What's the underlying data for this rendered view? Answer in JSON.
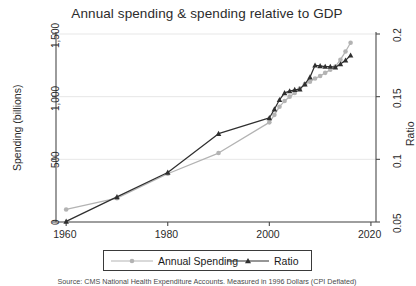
{
  "chart_data": {
    "type": "line",
    "title": "Annual spending & spending relative to GDP",
    "source_note": "Source: CMS National Health Expenditure Accounts. Measured in 1996 Dollars (CPI Deflated)",
    "xlabel": "",
    "ylabel": "Spending (billions)",
    "y2label": "Ratio",
    "xlim": [
      1958,
      2021
    ],
    "ylim": [
      0,
      1500
    ],
    "y2lim": [
      0.05,
      0.2
    ],
    "xticks": [
      "1960",
      "1980",
      "2000",
      "2020"
    ],
    "xtick_values": [
      1960,
      1980,
      2000,
      2020
    ],
    "yticks": [
      "0",
      "500",
      "1,000",
      "1,500"
    ],
    "ytick_values": [
      0,
      500,
      1000,
      1500
    ],
    "y2ticks": [
      "0.05",
      "0.1",
      "0.15",
      "0.2"
    ],
    "y2tick_values": [
      0.05,
      0.1,
      0.15,
      0.2
    ],
    "grid": true,
    "legend_position": "bottom",
    "series": [
      {
        "name": "Annual Spending",
        "axis": "left",
        "color": "#b3b3b3",
        "marker": "circle",
        "x": [
          1960,
          1970,
          1980,
          1990,
          2000,
          2001,
          2002,
          2003,
          2004,
          2005,
          2006,
          2007,
          2008,
          2009,
          2010,
          2011,
          2012,
          2013,
          2014,
          2015,
          2016
        ],
        "y": [
          100,
          190,
          385,
          550,
          795,
          855,
          920,
          965,
          1000,
          1030,
          1065,
          1100,
          1120,
          1145,
          1165,
          1190,
          1215,
          1240,
          1295,
          1360,
          1430
        ]
      },
      {
        "name": "Ratio",
        "axis": "right",
        "color": "#2f2f2f",
        "marker": "triangle",
        "x": [
          1960,
          1970,
          1980,
          1990,
          2000,
          2001,
          2002,
          2003,
          2004,
          2005,
          2006,
          2007,
          2008,
          2009,
          2010,
          2011,
          2012,
          2013,
          2014,
          2015,
          2016
        ],
        "y": [
          0.0505,
          0.07,
          0.0895,
          0.1205,
          0.133,
          0.14,
          0.1475,
          0.153,
          0.1545,
          0.1555,
          0.156,
          0.16,
          0.1655,
          0.175,
          0.1745,
          0.174,
          0.174,
          0.1735,
          0.176,
          0.179,
          0.183
        ]
      }
    ]
  },
  "legend": {
    "items": [
      {
        "label": "Annual Spending",
        "marker": "circle",
        "color": "#b3b3b3"
      },
      {
        "label": "Ratio",
        "marker": "triangle",
        "color": "#2f2f2f"
      }
    ]
  }
}
